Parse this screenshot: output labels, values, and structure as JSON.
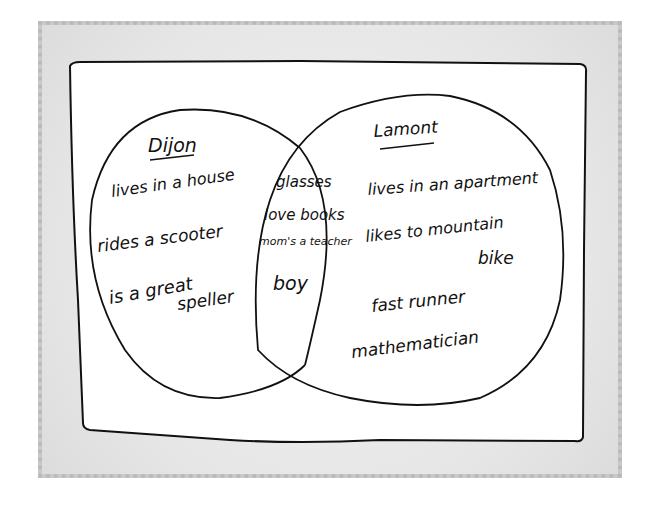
{
  "diagram": {
    "type": "venn",
    "colors": {
      "mat": "#e6e6e6",
      "mat_border": "#c4c4c4",
      "paper": "#ffffff",
      "ink": "#111111"
    },
    "left_set": {
      "title": "Dijon",
      "items": [
        "lives in a house",
        "rides a scooter",
        "is a great",
        "speller"
      ]
    },
    "intersection": {
      "items": [
        "glasses",
        "love books",
        "mom's a teacher",
        "boy"
      ]
    },
    "right_set": {
      "title": "Lamont",
      "items": [
        "lives in an apartment",
        "likes to mountain",
        "bike",
        "fast runner",
        "mathematician"
      ]
    }
  }
}
